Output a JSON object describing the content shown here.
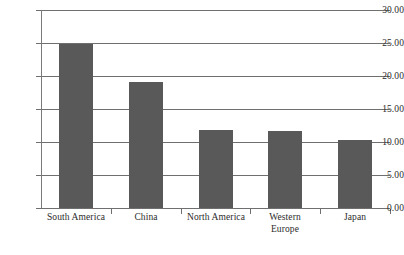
{
  "chart_data": {
    "type": "bar",
    "title": "",
    "subtitle": "",
    "xlabel": "",
    "ylabel": "",
    "categories": [
      "South America",
      "China",
      "North America",
      "Western Europe",
      "Japan"
    ],
    "values": [
      24.8,
      19.1,
      11.85,
      11.6,
      10.3
    ],
    "series": [
      {
        "name": "",
        "values": [
          24.8,
          19.1,
          11.85,
          11.6,
          10.3
        ]
      }
    ],
    "ylim": [
      0,
      30
    ],
    "ytick_values": [
      0,
      5,
      10,
      15,
      20,
      25,
      30
    ],
    "ytick_labels": [
      "0.00",
      "5.00",
      "10.00",
      "15.00",
      "20.00",
      "25.00",
      "30.00"
    ],
    "grid": true,
    "grid_axis": "y",
    "legend": false,
    "legend_position": "none",
    "annotations": [],
    "bar_color": "#595959",
    "grid_color": "#6f6f6f",
    "axis_color": "#7a7a7a",
    "background_color": "#ffffff",
    "text_color": "#2b2b2b"
  },
  "axes": {
    "y": {
      "ticks": [
        {
          "label": "30.00",
          "value": 30
        },
        {
          "label": "25.00",
          "value": 25
        },
        {
          "label": "20.00",
          "value": 20
        },
        {
          "label": "15.00",
          "value": 15
        },
        {
          "label": "10.00",
          "value": 10
        },
        {
          "label": "5.00",
          "value": 5
        },
        {
          "label": "0.00",
          "value": 0
        }
      ]
    },
    "x": {
      "ticks": [
        {
          "label": "South America"
        },
        {
          "label": "China"
        },
        {
          "label": "North America"
        },
        {
          "label": "Western\nEurope"
        },
        {
          "label": "Japan"
        }
      ]
    }
  }
}
